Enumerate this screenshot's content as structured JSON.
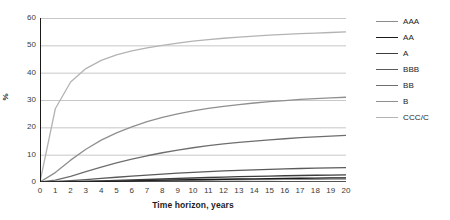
{
  "chart_data": {
    "type": "line",
    "title": "",
    "xlabel": "Time horizon, years",
    "ylabel": "%",
    "xlim": [
      0,
      20
    ],
    "ylim": [
      0,
      60
    ],
    "grid": "horizontal",
    "legend_position": "right",
    "x": [
      0,
      1,
      2,
      3,
      4,
      5,
      6,
      7,
      8,
      9,
      10,
      11,
      12,
      13,
      14,
      15,
      16,
      17,
      18,
      19,
      20
    ],
    "x_ticks": [
      "0",
      "1",
      "2",
      "3",
      "4",
      "5",
      "6",
      "7",
      "8",
      "9",
      "10",
      "11",
      "12",
      "13",
      "14",
      "15",
      "16",
      "17",
      "18",
      "19",
      "20"
    ],
    "y_ticks": [
      "0",
      "10",
      "20",
      "30",
      "40",
      "50",
      "60"
    ],
    "series": [
      {
        "name": "AAA",
        "color": "#8c8c8c",
        "values": [
          0,
          0.0,
          0.03,
          0.13,
          0.24,
          0.35,
          0.46,
          0.51,
          0.58,
          0.64,
          0.7,
          0.73,
          0.76,
          0.79,
          0.84,
          0.9,
          0.93,
          0.96,
          0.99,
          1.02,
          1.05
        ]
      },
      {
        "name": "AA",
        "color": "#1a1a1a",
        "values": [
          0,
          0.02,
          0.07,
          0.14,
          0.24,
          0.34,
          0.45,
          0.56,
          0.66,
          0.75,
          0.83,
          0.92,
          1.0,
          1.09,
          1.17,
          1.25,
          1.32,
          1.38,
          1.43,
          1.48,
          1.53
        ]
      },
      {
        "name": "A",
        "color": "#3d3d3d",
        "values": [
          0,
          0.06,
          0.15,
          0.27,
          0.41,
          0.57,
          0.74,
          0.92,
          1.1,
          1.29,
          1.47,
          1.64,
          1.79,
          1.93,
          2.05,
          2.17,
          2.28,
          2.38,
          2.47,
          2.55,
          2.62
        ]
      },
      {
        "name": "BBB",
        "color": "#5a5a5a",
        "values": [
          0,
          0.18,
          0.5,
          0.86,
          1.3,
          1.74,
          2.16,
          2.54,
          2.9,
          3.23,
          3.54,
          3.82,
          4.05,
          4.26,
          4.46,
          4.64,
          4.8,
          4.94,
          5.06,
          5.16,
          5.24
        ]
      },
      {
        "name": "BB",
        "color": "#6e6e6e",
        "values": [
          0,
          0.72,
          2.1,
          3.76,
          5.42,
          6.98,
          8.36,
          9.6,
          10.7,
          11.68,
          12.53,
          13.28,
          13.94,
          14.5,
          14.99,
          15.44,
          15.83,
          16.2,
          16.52,
          16.8,
          17.05
        ]
      },
      {
        "name": "B",
        "color": "#8f8f8f",
        "values": [
          0,
          3.44,
          8.0,
          12.0,
          15.3,
          18.0,
          20.2,
          22.1,
          23.6,
          24.9,
          26.0,
          26.9,
          27.7,
          28.3,
          28.9,
          29.4,
          29.8,
          30.2,
          30.5,
          30.8,
          31.0
        ]
      },
      {
        "name": "CCC/C",
        "color": "#b3b3b3",
        "values": [
          0,
          26.8,
          36.6,
          41.5,
          44.5,
          46.5,
          48.0,
          49.1,
          50.0,
          50.8,
          51.5,
          52.1,
          52.6,
          53.0,
          53.4,
          53.7,
          54.0,
          54.3,
          54.5,
          54.7,
          54.9
        ]
      }
    ]
  },
  "axes": {
    "y_title": "%",
    "x_title": "Time horizon, years"
  },
  "legend": {
    "items": [
      {
        "label": "AAA",
        "color": "#8c8c8c"
      },
      {
        "label": "AA",
        "color": "#1a1a1a"
      },
      {
        "label": "A",
        "color": "#3d3d3d"
      },
      {
        "label": "BBB",
        "color": "#5a5a5a"
      },
      {
        "label": "BB",
        "color": "#6e6e6e"
      },
      {
        "label": "B",
        "color": "#8f8f8f"
      },
      {
        "label": "CCC/C",
        "color": "#b3b3b3"
      }
    ]
  },
  "style": {
    "grid_color": "#b9b9b9",
    "axis_color": "#1a1a1a",
    "background": "#ffffff"
  }
}
